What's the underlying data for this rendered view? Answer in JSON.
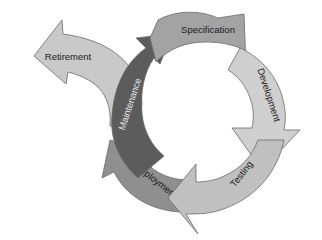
{
  "diagram": {
    "type": "cycle",
    "title": "",
    "stages": [
      {
        "id": "specification",
        "label": "Specification",
        "color": "#a3a3a3"
      },
      {
        "id": "development",
        "label": "Development",
        "color": "#cfcfcf"
      },
      {
        "id": "testing",
        "label": "Testing",
        "color": "#c0c0c0"
      },
      {
        "id": "deployment",
        "label": "Deployment",
        "color": "#8f8f8f"
      },
      {
        "id": "maintenance",
        "label": "Maintenance",
        "color": "#5c5c5c"
      }
    ],
    "exit": {
      "id": "retirement",
      "label": "Retirement",
      "color": "#c9c9c9"
    },
    "flow": [
      "Specification",
      "Development",
      "Testing",
      "Deployment",
      "Maintenance",
      "Specification"
    ],
    "branch": {
      "from": "Maintenance",
      "to": "Retirement"
    }
  }
}
